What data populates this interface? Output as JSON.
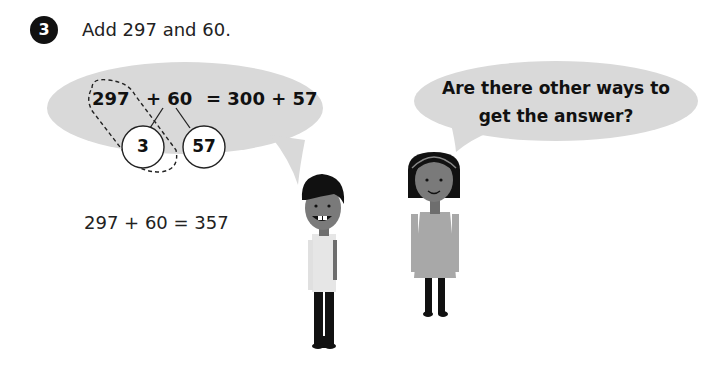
{
  "question": {
    "number": "3",
    "prompt": "Add 297 and 60."
  },
  "working_bubble": {
    "term1": "297",
    "term2": "+ 60",
    "result": "= 300 + 57",
    "split_parts": [
      "3",
      "57"
    ]
  },
  "girl_bubble": {
    "line1": "Are there other ways to",
    "line2": "get the answer?"
  },
  "answer": {
    "text": "297 + 60 = 357"
  },
  "colors": {
    "bubble_fill": "#d9d9d9",
    "badge": "#111111",
    "skin": "#7a7a7a",
    "hair": "#111111"
  }
}
